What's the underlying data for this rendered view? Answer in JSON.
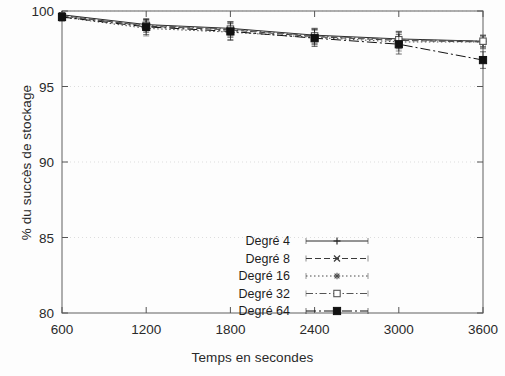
{
  "chart_data": {
    "type": "line",
    "title": "",
    "xlabel": "Temps en secondes",
    "ylabel": "% du succès de stockage",
    "x": [
      600,
      1200,
      1800,
      2400,
      3000,
      3600
    ],
    "xticklabels": [
      "600",
      "1200",
      "1800",
      "2400",
      "3000",
      "3600"
    ],
    "yticklabels": [
      "80",
      "85",
      "90",
      "95",
      "100"
    ],
    "yticks": [
      80,
      85,
      90,
      95,
      100
    ],
    "xlim": [
      600,
      3600
    ],
    "ylim": [
      80,
      100
    ],
    "grid": true,
    "grid_axis": "y",
    "legend_position": "center",
    "errorbars": true,
    "series": [
      {
        "name": "Degé 4",
        "label": "Degré 4",
        "marker": "plus",
        "linestyle": "solid",
        "color": "#2b2b2b",
        "values": [
          99.75,
          99.1,
          98.85,
          98.4,
          98.15,
          98.0
        ],
        "errors": [
          0.15,
          0.35,
          0.45,
          0.45,
          0.5,
          0.35
        ]
      },
      {
        "name": "Degre 8",
        "label": "Degré 8",
        "marker": "cross",
        "linestyle": "dashed",
        "color": "#3a3a3a",
        "values": [
          99.7,
          99.0,
          98.75,
          98.3,
          98.05,
          97.95
        ],
        "errors": [
          0.2,
          0.4,
          0.5,
          0.5,
          0.55,
          0.4
        ]
      },
      {
        "name": "Degre 16",
        "label": "Degré 16",
        "marker": "star",
        "linestyle": "dotted",
        "color": "#4a4a4a",
        "values": [
          99.6,
          98.85,
          98.6,
          98.25,
          97.95,
          97.95
        ],
        "errors": [
          0.25,
          0.5,
          0.55,
          0.5,
          0.6,
          0.45
        ]
      },
      {
        "name": "Degre 32",
        "label": "Degré 32",
        "marker": "open-square",
        "linestyle": "dashdot",
        "color": "#555555",
        "values": [
          99.65,
          99.05,
          98.8,
          98.35,
          98.1,
          98.0
        ],
        "errors": [
          0.2,
          0.45,
          0.5,
          0.5,
          0.55,
          0.4
        ]
      },
      {
        "name": "Degre 64",
        "label": "Degré 64",
        "marker": "filled-square",
        "linestyle": "dashdot-long",
        "color": "#111111",
        "values": [
          99.6,
          98.95,
          98.65,
          98.2,
          97.8,
          96.75
        ],
        "errors": [
          0.25,
          0.5,
          0.55,
          0.55,
          0.65,
          0.55
        ]
      }
    ]
  }
}
